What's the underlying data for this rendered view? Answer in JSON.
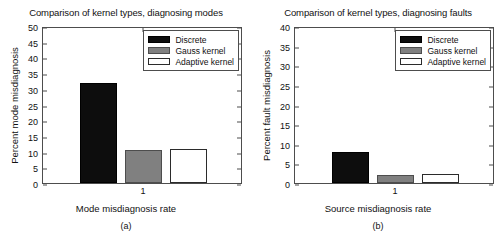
{
  "figure": {
    "panels": [
      {
        "id": "a",
        "title": "Comparison of kernel types, diagnosing modes",
        "ylabel": "Percent mode misdiagnosis",
        "xlabel": "Mode misdiagnosis rate",
        "subcaption": "(a)",
        "yticks": [
          "0",
          "5",
          "10",
          "15",
          "20",
          "25",
          "30",
          "35",
          "40",
          "45",
          "50"
        ],
        "xticks": [
          "1"
        ]
      },
      {
        "id": "b",
        "title": "Comparison of kernel types, diagnosing faults",
        "ylabel": "Percent fault misdiagnosis",
        "xlabel": "Source misdiagnosis rate",
        "subcaption": "(b)",
        "yticks": [
          "0",
          "5",
          "10",
          "15",
          "20",
          "25",
          "30",
          "35",
          "40"
        ],
        "xticks": [
          "1"
        ]
      }
    ],
    "legend": {
      "entries": [
        {
          "label": "Discrete",
          "swatch": "discrete",
          "color": "#0d0d0d"
        },
        {
          "label": "Gauss kernel",
          "swatch": "gauss",
          "color": "#808080"
        },
        {
          "label": "Adaptive kernel",
          "swatch": "adaptive",
          "color": "#ffffff"
        }
      ]
    }
  },
  "chart_data": [
    {
      "type": "bar",
      "panel": "a",
      "title": "Comparison of kernel types, diagnosing modes",
      "xlabel": "Mode misdiagnosis rate",
      "ylabel": "Percent mode misdiagnosis",
      "categories": [
        "1"
      ],
      "xtick_labels": [
        "1"
      ],
      "series": [
        {
          "name": "Discrete",
          "values": [
            31.8
          ],
          "color": "#0d0d0d"
        },
        {
          "name": "Gauss kernel",
          "values": [
            10.5
          ],
          "color": "#808080"
        },
        {
          "name": "Adaptive kernel",
          "values": [
            10.8
          ],
          "color": "#ffffff"
        }
      ],
      "ylim": [
        0,
        50
      ],
      "ytick_step": 5,
      "ytick_labels": [
        "0",
        "5",
        "10",
        "15",
        "20",
        "25",
        "30",
        "35",
        "40",
        "45",
        "50"
      ],
      "grid": false,
      "legend_position": "top-right",
      "subcaption": "(a)"
    },
    {
      "type": "bar",
      "panel": "b",
      "title": "Comparison of kernel types, diagnosing faults",
      "xlabel": "Source misdiagnosis rate",
      "ylabel": "Percent fault misdiagnosis",
      "categories": [
        "1"
      ],
      "xtick_labels": [
        "1"
      ],
      "series": [
        {
          "name": "Discrete",
          "values": [
            7.8
          ],
          "color": "#0d0d0d"
        },
        {
          "name": "Gauss kernel",
          "values": [
            2.0
          ],
          "color": "#808080"
        },
        {
          "name": "Adaptive kernel",
          "values": [
            2.2
          ],
          "color": "#ffffff"
        }
      ],
      "ylim": [
        0,
        40
      ],
      "ytick_step": 5,
      "ytick_labels": [
        "0",
        "5",
        "10",
        "15",
        "20",
        "25",
        "30",
        "35",
        "40"
      ],
      "grid": false,
      "legend_position": "top-right",
      "subcaption": "(b)"
    }
  ]
}
